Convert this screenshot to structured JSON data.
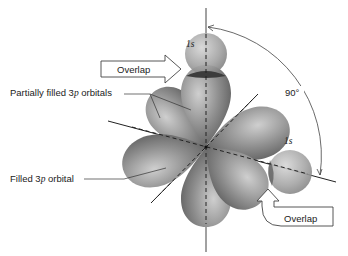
{
  "labels": {
    "s_top": "1s",
    "s_right": "1s",
    "overlap_top": "Overlap",
    "overlap_right": "Overlap",
    "angle": "90°",
    "partially_filled_prefix": "Partially filled 3",
    "partially_filled_p": "p",
    "partially_filled_suffix": " orbitals",
    "filled_prefix": "Filled 3",
    "filled_p": "p",
    "filled_suffix": " orbital"
  },
  "colors": {
    "lobe": "#8a8a8a",
    "lobe_highlight": "#c9c9c9",
    "s_orbital": "#9c9c9c",
    "overlap": "#3c3c3c",
    "axis": "#222222",
    "background": "#ffffff"
  }
}
